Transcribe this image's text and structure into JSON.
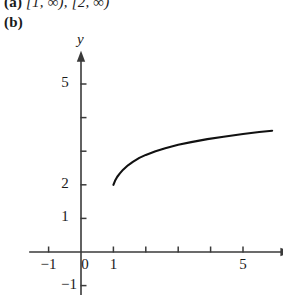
{
  "answers": {
    "part_a": {
      "label": "(a)",
      "text": "[1, ∞), [2, ∞)"
    },
    "part_b": {
      "label": "(b)"
    }
  },
  "chart_data": {
    "type": "line",
    "title": "",
    "xlabel": "x",
    "ylabel": "y",
    "xlim": [
      -1.6,
      6.4
    ],
    "ylim": [
      -1.3,
      5.9
    ],
    "grid": false,
    "legend": null,
    "x_ticks": [
      -1,
      0,
      1,
      2,
      3,
      4,
      5
    ],
    "x_tick_labels": [
      "-1",
      "0",
      "1",
      "",
      "",
      "",
      "5"
    ],
    "y_ticks": [
      -1,
      1,
      2,
      3,
      4,
      5
    ],
    "y_tick_labels": [
      "-1",
      "1",
      "2",
      "",
      "",
      "5"
    ],
    "series": [
      {
        "name": "curve",
        "color": "#111111",
        "domain": [
          1,
          5.9
        ],
        "x": [
          1.0,
          1.05,
          1.12,
          1.2,
          1.3,
          1.45,
          1.6,
          1.8,
          2.0,
          2.3,
          2.6,
          3.0,
          3.4,
          3.9,
          4.4,
          5.0,
          5.5,
          5.9
        ],
        "y": [
          2.0,
          2.12,
          2.24,
          2.34,
          2.45,
          2.58,
          2.68,
          2.8,
          2.89,
          3.0,
          3.09,
          3.19,
          3.27,
          3.36,
          3.43,
          3.51,
          3.57,
          3.61
        ]
      }
    ]
  },
  "axis_labels": {
    "x": "x",
    "y": "y"
  },
  "colors": {
    "curve": "#111111",
    "axis": "#3a3a3a",
    "text": "#1a1a1a",
    "background": "#ffffff"
  }
}
